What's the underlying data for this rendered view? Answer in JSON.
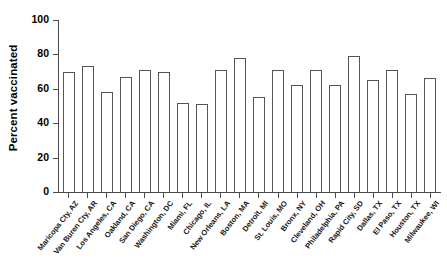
{
  "chart_data": {
    "type": "bar",
    "title": "",
    "xlabel": "",
    "ylabel": "Percent vaccinated",
    "ylim": [
      0,
      100
    ],
    "yticks": [
      0,
      20,
      40,
      60,
      80,
      100
    ],
    "ytick_labels": [
      "0",
      "20",
      "40",
      "60",
      "80",
      "100"
    ],
    "grid": false,
    "legend": null,
    "bar_style": {
      "fill": "#ffffff",
      "edge": "#555555"
    },
    "categories": [
      "Maricopa Cty, AZ",
      "Van Buren Cty, AR",
      "Los Angeles, CA",
      "Oakland, CA",
      "San Diego, CA",
      "Washington, DC",
      "Miami, FL",
      "Chicago, IL",
      "New Orleans, LA",
      "Boston, MA",
      "Detroit, MI",
      "St. Louis, MO",
      "Bronx, NY",
      "Cleveland, OH",
      "Philadelphia, PA",
      "Rapid City, SD",
      "Dallas, TX",
      "El Paso, TX",
      "Houston, TX",
      "Milwaukee, WI"
    ],
    "values": [
      70,
      73,
      58,
      67,
      71,
      70,
      52,
      51,
      71,
      78,
      55,
      71,
      62,
      71,
      62,
      79,
      65,
      71,
      57,
      66
    ]
  }
}
